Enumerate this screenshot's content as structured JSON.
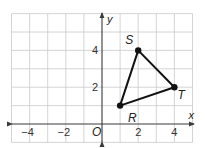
{
  "diagram": {
    "type": "coordinate-plane",
    "x_axis": {
      "label": "x",
      "range": [
        -5,
        5
      ],
      "ticks": [
        {
          "value": -4,
          "label": "−4"
        },
        {
          "value": -2,
          "label": "−2"
        },
        {
          "value": 2,
          "label": "2"
        },
        {
          "value": 4,
          "label": "4"
        }
      ]
    },
    "y_axis": {
      "label": "y",
      "range": [
        -1,
        6
      ],
      "ticks": [
        {
          "value": 2,
          "label": "2"
        },
        {
          "value": 4,
          "label": "4"
        }
      ]
    },
    "origin_label": "O",
    "grid": true,
    "polygon": {
      "name": "triangle RST",
      "vertices": [
        {
          "name": "R",
          "x": 1,
          "y": 1,
          "label_position": "below-right"
        },
        {
          "name": "S",
          "x": 2,
          "y": 4,
          "label_position": "above-left"
        },
        {
          "name": "T",
          "x": 4,
          "y": 2,
          "label_position": "below-right"
        }
      ],
      "edge_color": "#111111"
    },
    "colors": {
      "grid": "#c9c9c9",
      "axis": "#3a3a3a",
      "polygon": "#111111"
    }
  }
}
